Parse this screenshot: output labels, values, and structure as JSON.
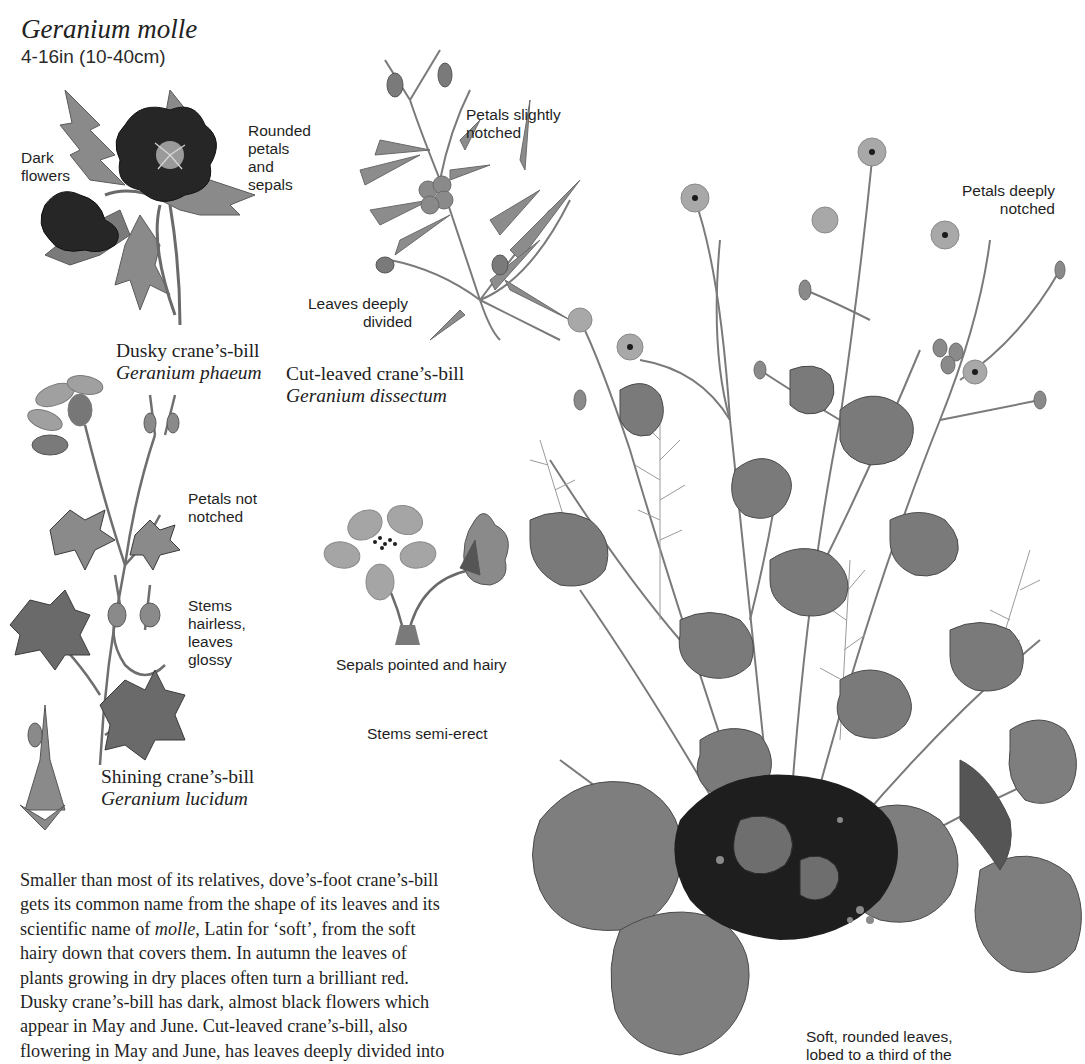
{
  "page": {
    "title": "Geranium molle",
    "size": "4-16in (10-40cm)"
  },
  "species": [
    {
      "common_name": "Dusky crane’s-bill",
      "scientific_name": "Geranium phaeum",
      "labels": [
        "Dark flowers",
        "Rounded petals and sepals"
      ]
    },
    {
      "common_name": "Cut-leaved crane’s-bill",
      "scientific_name": "Geranium dissectum",
      "labels": [
        "Petals slightly notched",
        "Leaves deeply divided"
      ]
    },
    {
      "common_name": "Shining crane’s-bill",
      "scientific_name": "Geranium lucidum",
      "labels": [
        "Petals not notched",
        "Stems hairless, leaves glossy"
      ]
    }
  ],
  "labels": {
    "dark_flowers_1": "Dark",
    "dark_flowers_2": "flowers",
    "rounded_1": "Rounded",
    "rounded_2": "petals",
    "rounded_3": "and",
    "rounded_4": "sepals",
    "slightly_notched_1": "Petals slightly",
    "slightly_notched_2": "notched",
    "leaves_divided_1": "Leaves deeply",
    "leaves_divided_2": "divided",
    "not_notched_1": "Petals not",
    "not_notched_2": "notched",
    "hairless_1": "Stems",
    "hairless_2": "hairless,",
    "hairless_3": "leaves",
    "hairless_4": "glossy",
    "sepals_pointed": "Sepals pointed and hairy",
    "stems_semi_erect": "Stems semi-erect",
    "deeply_notched_1": "Petals deeply",
    "deeply_notched_2": "notched",
    "soft_leaves_1": "Soft, rounded leaves,",
    "soft_leaves_2": "lobed to a third of the"
  },
  "body": {
    "lines": [
      "Smaller than most of its relatives, dove’s-foot crane’s-bill",
      "gets its common name from the shape of its leaves and its",
      "scientific name of ",
      "molle",
      ", Latin for ‘soft’, from the soft",
      "hairy down that covers them. In autumn the leaves of",
      "plants growing in dry places often turn a brilliant red.",
      "Dusky crane’s-bill has dark, almost black flowers which",
      "appear in May and June. Cut-leaved crane’s-bill, also",
      "flowering in May and June, has leaves deeply divided into"
    ]
  },
  "illustrations": {
    "dusky": "dusky-cranesbill-illustration",
    "cut_leaved": "cut-leaved-cranesbill-illustration",
    "shining": "shining-cranesbill-illustration",
    "sepals_detail": "geranium-molle-flower-detail",
    "main_plant": "geranium-molle-plant-illustration"
  },
  "colors": {
    "ink": "#1f1f1f",
    "leaf_mid": "#6e6e6e",
    "leaf_dark": "#3a3a3a",
    "flower_dark": "#202020",
    "stem": "#7a7a7a"
  }
}
